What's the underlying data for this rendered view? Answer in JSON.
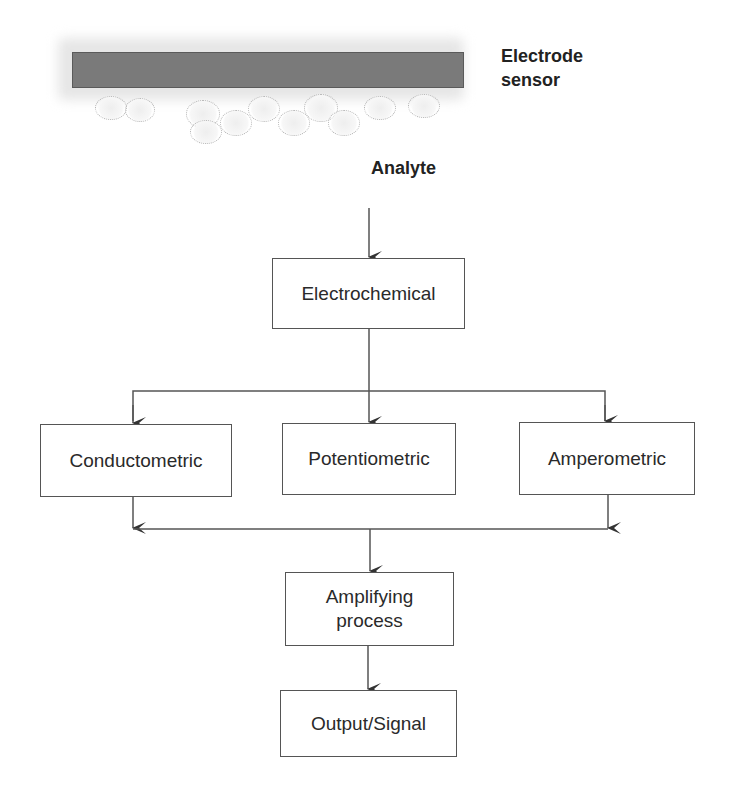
{
  "sensor": {
    "label_line1": "Electrode",
    "label_line2": "sensor",
    "bar_color": "#7a7a7a"
  },
  "analyte_label": "Analyte",
  "nodes": {
    "electrochemical": "Electrochemical",
    "conductometric": "Conductometric",
    "potentiometric": "Potentiometric",
    "amperometric": "Amperometric",
    "amplifying_line1": "Amplifying",
    "amplifying_line2": "process",
    "output": "Output/Signal"
  },
  "edges": [
    {
      "from": "Analyte",
      "to": "Electrochemical"
    },
    {
      "from": "Electrochemical",
      "to": "Conductometric"
    },
    {
      "from": "Electrochemical",
      "to": "Potentiometric"
    },
    {
      "from": "Electrochemical",
      "to": "Amperometric"
    },
    {
      "from": "Conductometric",
      "to": "Amplifying process"
    },
    {
      "from": "Potentiometric",
      "to": "Amplifying process"
    },
    {
      "from": "Amperometric",
      "to": "Amplifying process"
    },
    {
      "from": "Amplifying process",
      "to": "Output/Signal"
    }
  ]
}
